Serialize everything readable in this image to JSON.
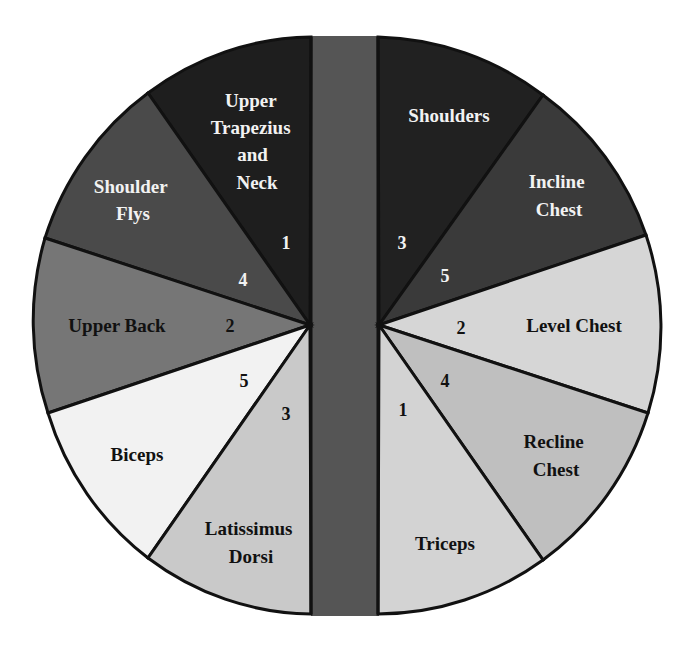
{
  "diagram": {
    "title": "",
    "type": "split-pie",
    "center_bar": {
      "color": "#555555"
    },
    "outline_color": "#111111",
    "left": {
      "apex": [
        310,
        325
      ],
      "segments": [
        {
          "id": "upper-trapezius-and-neck",
          "label_lines": [
            "Upper",
            "Trapezius",
            "and",
            "Neck"
          ],
          "number": "1",
          "color": "#1e1e1e",
          "text_color": "#f2f2f2"
        },
        {
          "id": "shoulder-flys",
          "label_lines": [
            "Shoulder",
            "Flys"
          ],
          "number": "4",
          "color": "#4a4a4a",
          "text_color": "#f2f2f2"
        },
        {
          "id": "upper-back",
          "label_lines": [
            "Upper Back"
          ],
          "number": "2",
          "color": "#767676",
          "text_color": "#111111"
        },
        {
          "id": "biceps",
          "label_lines": [
            "Biceps"
          ],
          "number": "5",
          "color": "#f2f2f2",
          "text_color": "#111111"
        },
        {
          "id": "latissimus-dorsi",
          "label_lines": [
            "Latissimus",
            "Dorsi"
          ],
          "number": "3",
          "color": "#c9c9c9",
          "text_color": "#111111"
        }
      ]
    },
    "right": {
      "apex": [
        379,
        325
      ],
      "segments": [
        {
          "id": "shoulders",
          "label_lines": [
            "Shoulders"
          ],
          "number": "3",
          "color": "#212121",
          "text_color": "#f2f2f2"
        },
        {
          "id": "incline-chest",
          "label_lines": [
            "Incline",
            "Chest"
          ],
          "number": "5",
          "color": "#3a3a3a",
          "text_color": "#f2f2f2"
        },
        {
          "id": "level-chest",
          "label_lines": [
            "Level Chest"
          ],
          "number": "2",
          "color": "#d6d6d6",
          "text_color": "#111111"
        },
        {
          "id": "recline-chest",
          "label_lines": [
            "Recline",
            "Chest"
          ],
          "number": "4",
          "color": "#bfbfbf",
          "text_color": "#111111"
        },
        {
          "id": "triceps",
          "label_lines": [
            "Triceps"
          ],
          "number": "1",
          "color": "#d3d3d3",
          "text_color": "#111111"
        }
      ]
    }
  }
}
